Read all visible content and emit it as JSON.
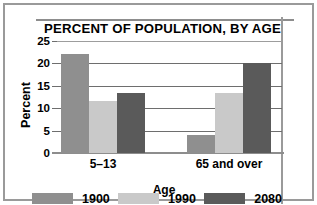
{
  "chart_data": {
    "type": "bar",
    "title": "PERCENT OF POPULATION, BY AGE",
    "xlabel": "Age",
    "ylabel": "Percent",
    "categories": [
      "5–13",
      "65 and over"
    ],
    "series": [
      {
        "name": "1900",
        "values": [
          22,
          4
        ],
        "color": "#8f8f8f"
      },
      {
        "name": "1990",
        "values": [
          11.5,
          13.5
        ],
        "color": "#c9c9c9"
      },
      {
        "name": "2080",
        "values": [
          13.5,
          20
        ],
        "color": "#5a5a5a"
      }
    ],
    "yticks": [
      0,
      5,
      10,
      15,
      20,
      25
    ],
    "ytick_labels": [
      "0",
      "5",
      "10",
      "15",
      "20",
      "25"
    ],
    "ylim": [
      0,
      25
    ],
    "grid": true,
    "legend_position": "bottom",
    "source": "Source: U.S. Bureau of the Census"
  },
  "legend": {
    "items": [
      {
        "label": "1900",
        "color": "#8f8f8f"
      },
      {
        "label": "1990",
        "color": "#c9c9c9"
      },
      {
        "label": "2080",
        "color": "#5a5a5a"
      }
    ]
  },
  "colors": {
    "frame": "#9a9a9a",
    "gridline": "#6e6e6e",
    "text": "#000000"
  }
}
